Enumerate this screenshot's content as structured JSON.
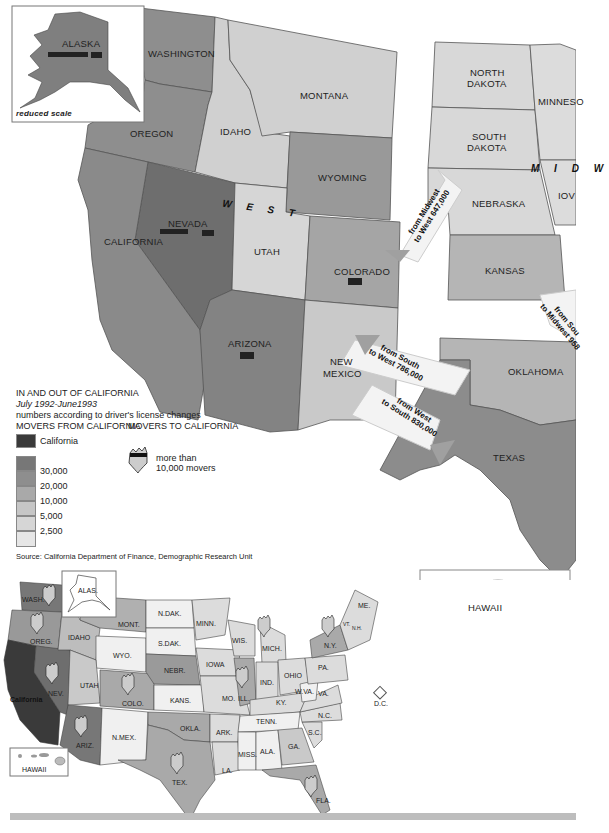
{
  "colors": {
    "california": "#3a3a3a",
    "band_30000": "#777777",
    "band_20000": "#8e8e8e",
    "band_10000": "#a9a9a9",
    "band_5000": "#c6c6c6",
    "band_2500": "#d6d6d6",
    "band_low": "#e6e6e6",
    "arrow": "#f4f4f4",
    "arrow_head": "#9a9a9a"
  },
  "main_map": {
    "inset_alaska": {
      "label": "ALASKA",
      "caption": "reduced scale"
    },
    "region_labels": {
      "west": "W E S T",
      "midwest": "M I D W"
    },
    "states": {
      "washington": "WASHINGTON",
      "oregon": "OREGON",
      "idaho": "IDAHO",
      "montana": "MONTANA",
      "wyoming": "WYOMING",
      "nevada": "NEVADA",
      "utah": "UTAH",
      "california": "CALIFORNIA",
      "colorado": "COLORADO",
      "arizona": "ARIZONA",
      "new_mexico_1": "NEW",
      "new_mexico_2": "MEXICO",
      "north_dakota_1": "NORTH",
      "north_dakota_2": "DAKOTA",
      "south_dakota_1": "SOUTH",
      "south_dakota_2": "DAKOTA",
      "minnesota": "MINNESO",
      "nebraska": "NEBRASKA",
      "iowa": "IOV",
      "kansas": "KANSAS",
      "oklahoma": "OKLAHOMA",
      "texas": "TEXAS",
      "hawaii": "HAWAII"
    },
    "arrows": [
      {
        "line1": "from Midwest",
        "line2": "to West 647,000"
      },
      {
        "line1": "from South",
        "line2": "to West 786,000"
      },
      {
        "line1": "from West",
        "line2": "to South 830,000"
      },
      {
        "line1": "from Sou",
        "line2": "to Midwest 958"
      }
    ]
  },
  "legend": {
    "title": "IN AND OUT OF CALIFORNIA",
    "period": "July 1992-June1993",
    "note": "numbers according to driver's license changes",
    "from_header": "MOVERS FROM CALIFORNIA",
    "to_header": "MOVERS TO CALIFORNIA",
    "california_label": "California",
    "ticks": [
      "30,000",
      "20,000",
      "10,000",
      "5,000",
      "2,500"
    ],
    "shield_label_1": "more than",
    "shield_label_2": "10,000 movers",
    "source": "Source: California Department of Finance, Demographic Research Unit"
  },
  "us_map": {
    "states": {
      "wash": "WASH.",
      "oreg": "OREG.",
      "idaho": "IDAHO",
      "mont": "MONT.",
      "wyo": "WYO.",
      "nev": "NEV.",
      "utah": "UTAH",
      "colo": "COLO.",
      "ariz": "ARIZ.",
      "nmex": "N.MEX.",
      "california": "California",
      "alas": "ALAS.",
      "ndak": "N.DAK.",
      "sdak": "S.DAK.",
      "nebr": "NEBR.",
      "kans": "KANS.",
      "okla": "OKLA.",
      "tex": "TEX.",
      "minn": "MINN.",
      "iowa": "IOWA",
      "mo": "MO.",
      "ark": "ARK.",
      "la": "LA.",
      "wis": "WIS.",
      "ill": "ILL.",
      "mich": "MICH.",
      "ind": "IND.",
      "ohio": "OHIO",
      "ky": "KY.",
      "tenn": "TENN.",
      "miss": "MISS.",
      "ala": "ALA.",
      "ga": "GA.",
      "fla": "FLA.",
      "sc": "S.C.",
      "nc": "N.C.",
      "va": "VA.",
      "wva": "W.VA.",
      "pa": "PA.",
      "ny": "N.Y.",
      "me": "ME.",
      "vt": "VT.",
      "nh": "N.H.",
      "dc": "D.C.",
      "hawaii": "HAWAII"
    }
  }
}
